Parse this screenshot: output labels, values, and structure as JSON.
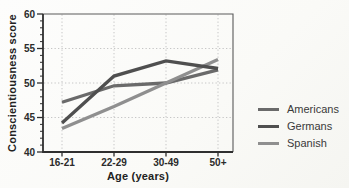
{
  "chart_data": {
    "type": "line",
    "title": "",
    "xlabel": "Age (years)",
    "ylabel": "Conscientiousness score",
    "categories": [
      "16-21",
      "22-29",
      "30-49",
      "50+"
    ],
    "series": [
      {
        "name": "Americans",
        "color": "#6a6a6a",
        "values": [
          47.2,
          49.6,
          50.0,
          51.9
        ]
      },
      {
        "name": "Germans",
        "color": "#4f4f4f",
        "values": [
          44.2,
          51.0,
          53.2,
          52.1
        ]
      },
      {
        "name": "Spanish",
        "color": "#8f8f8f",
        "values": [
          43.4,
          46.6,
          50.0,
          53.4
        ]
      }
    ],
    "ylim": [
      40,
      60
    ],
    "yticks": [
      40,
      45,
      50,
      55,
      60
    ],
    "y_minor_tick_step": 1,
    "grid": {
      "horizontal_at": [
        45,
        50,
        55
      ],
      "vertical": "at-categories",
      "style": "dotted",
      "color": "#c6c6c6"
    },
    "legend": {
      "position": "right-middle",
      "entries": [
        "Americans",
        "Germans",
        "Spanish"
      ]
    },
    "axis_color": "#2f2f2f",
    "tick_label_color": "#2b2b2b"
  }
}
